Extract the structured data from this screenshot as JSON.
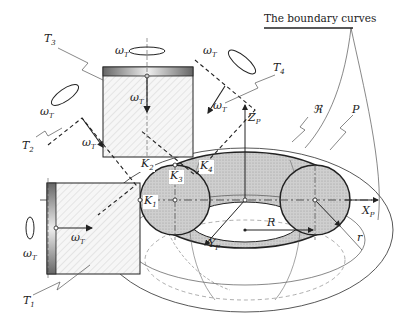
{
  "diagram": {
    "title": "The boundary curves",
    "tools": [
      {
        "id": "T1",
        "label": "T",
        "sub": "1"
      },
      {
        "id": "T2",
        "label": "T",
        "sub": "2"
      },
      {
        "id": "T3",
        "label": "T",
        "sub": "3"
      },
      {
        "id": "T4",
        "label": "T",
        "sub": "4"
      }
    ],
    "contact_points": [
      {
        "id": "K1",
        "label": "K",
        "sub": "1"
      },
      {
        "id": "K2",
        "label": "K",
        "sub": "2"
      },
      {
        "id": "K3",
        "label": "K",
        "sub": "3"
      },
      {
        "id": "K4",
        "label": "K",
        "sub": "4"
      }
    ],
    "axes": {
      "x": {
        "label": "X",
        "sub": "P"
      },
      "y": {
        "label": "Y",
        "sub": "P"
      },
      "z": {
        "label": "Z",
        "sub": "P"
      }
    },
    "rotation": {
      "label": "ω",
      "sub": "T"
    },
    "surface_labels": {
      "region": "ℜ",
      "part": "P",
      "major_radius": "R",
      "minor_radius": "r"
    },
    "colors": {
      "line": "#222222",
      "torus_fill": "#d0d0d0",
      "hatch": "#bdbdbd"
    }
  }
}
